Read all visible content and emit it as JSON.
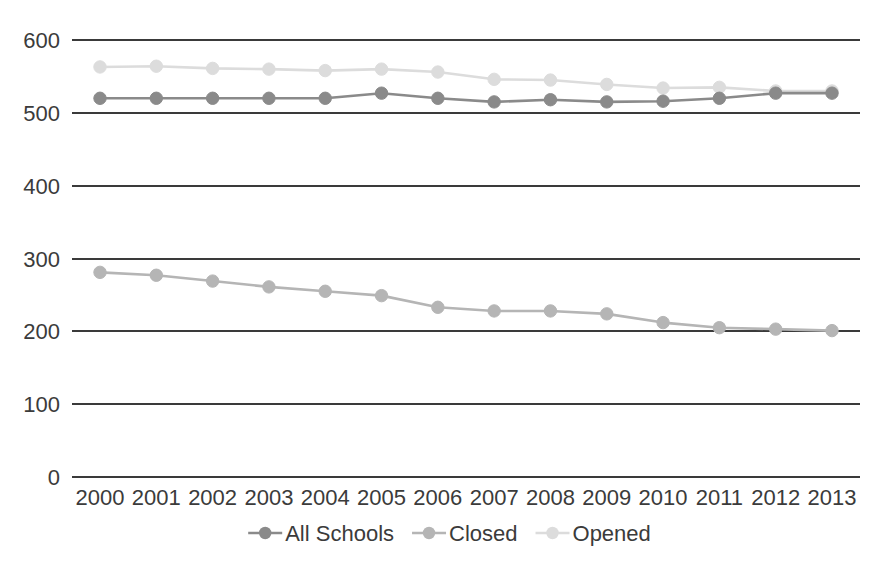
{
  "chart_data": {
    "type": "line",
    "title": "",
    "subtitle": "",
    "xlabel": "",
    "ylabel": "",
    "categories": [
      "2000",
      "2001",
      "2002",
      "2003",
      "2004",
      "2005",
      "2006",
      "2007",
      "2008",
      "2009",
      "2010",
      "2011",
      "2012",
      "2013"
    ],
    "x": [
      2000,
      2001,
      2002,
      2003,
      2004,
      2005,
      2006,
      2007,
      2008,
      2009,
      2010,
      2011,
      2012,
      2013
    ],
    "ylim": [
      0,
      600
    ],
    "yticks": [
      0,
      100,
      200,
      300,
      400,
      500,
      600
    ],
    "ytick_labels": [
      "0",
      "100",
      "200",
      "300",
      "400",
      "500",
      "600"
    ],
    "grid": true,
    "grid_axis": "y",
    "legend_position": "bottom",
    "markers": "circle",
    "series": [
      {
        "name": "All Schools",
        "color": "#8a8a8a",
        "values": [
          520,
          520,
          520,
          520,
          520,
          527,
          520,
          515,
          518,
          515,
          516,
          520,
          527,
          527
        ]
      },
      {
        "name": "Closed",
        "color": "#b5b5b5",
        "values": [
          281,
          277,
          269,
          261,
          255,
          249,
          233,
          228,
          228,
          224,
          212,
          205,
          203,
          201
        ]
      },
      {
        "name": "Opened",
        "color": "#dcdcdc",
        "values": [
          563,
          564,
          561,
          560,
          558,
          560,
          556,
          546,
          545,
          539,
          534,
          535,
          530,
          530
        ]
      }
    ]
  },
  "legend": {
    "items": [
      {
        "label": "All Schools",
        "color": "#8a8a8a"
      },
      {
        "label": "Closed",
        "color": "#b5b5b5"
      },
      {
        "label": "Opened",
        "color": "#dcdcdc"
      }
    ]
  },
  "axis": {
    "y_labels": [
      "600",
      "500",
      "400",
      "300",
      "200",
      "100",
      "0"
    ],
    "x_labels": [
      "2000",
      "2001",
      "2002",
      "2003",
      "2004",
      "2005",
      "2006",
      "2007",
      "2008",
      "2009",
      "2010",
      "2011",
      "2012",
      "2013"
    ]
  },
  "colors": {
    "grid": "#3a3a3a",
    "text": "#3b3b3b",
    "all_schools": "#8a8a8a",
    "closed": "#b5b5b5",
    "opened": "#dcdcdc",
    "background": "#ffffff"
  }
}
